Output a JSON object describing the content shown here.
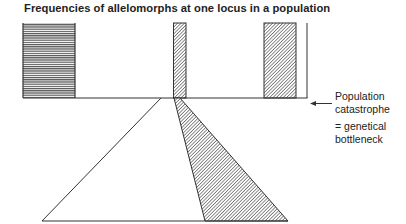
{
  "title": "Frequencies of allelomorphs at one locus in a population",
  "annotation": {
    "line1": "Population",
    "line2": "catastrophe",
    "line3": "= genetical",
    "line4": "bottleneck"
  },
  "diagram": {
    "upper_population_bars": [
      {
        "name": "allele-horizontal-hatch",
        "pattern": "horizontal"
      },
      {
        "name": "allele-diagonal-hatch-narrow",
        "pattern": "diagonal"
      },
      {
        "name": "allele-diagonal-hatch-wide",
        "pattern": "diagonal"
      }
    ],
    "lower_population": {
      "shape": "triangle",
      "shaded_fraction_pattern": "diagonal"
    },
    "colors": {
      "ink": "#333333",
      "background": "#ffffff"
    }
  }
}
